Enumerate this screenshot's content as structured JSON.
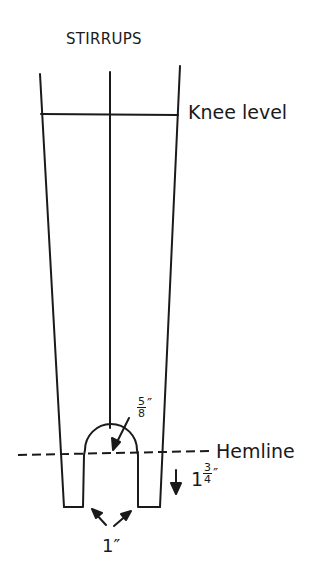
{
  "diagram": {
    "title": "STIRRUPS",
    "labels": {
      "knee_level": "Knee level",
      "hemline": "Hemline"
    },
    "measurements": {
      "arch_radius": {
        "numerator": "5",
        "denominator": "8",
        "unit": "″"
      },
      "stirrup_extension": {
        "whole": "1",
        "numerator": "3",
        "denominator": "4",
        "unit": "″"
      },
      "stirrup_width": "1″"
    },
    "colors": {
      "line": "#1a1a1a",
      "background": "#ffffff"
    }
  }
}
